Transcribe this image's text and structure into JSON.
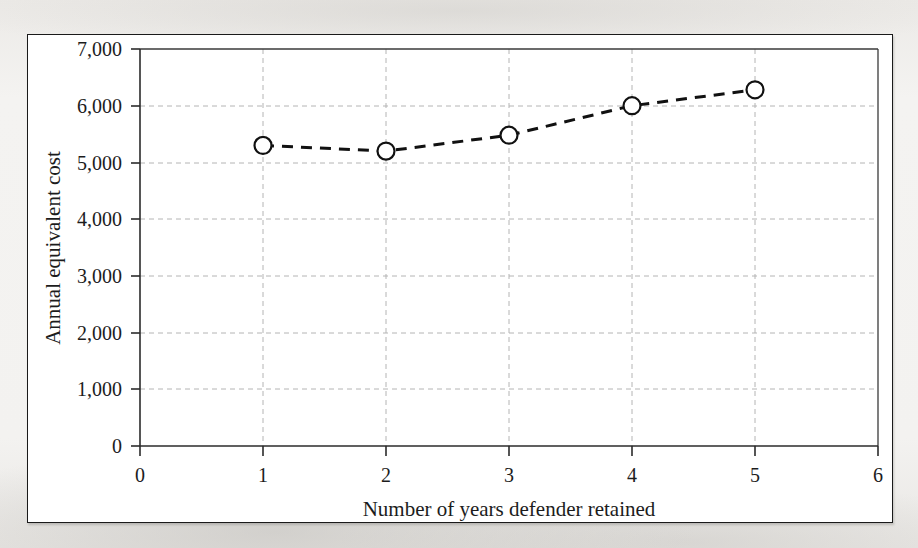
{
  "figure": {
    "background_color": "#f2f1ef",
    "panel_color": "#ffffff",
    "frame_color": "#1a1a1a"
  },
  "chart_data": {
    "type": "line",
    "title": "",
    "subtitle": "",
    "xlabel": "Number of years defender retained",
    "ylabel": "Annual equivalent cost",
    "x": [
      1,
      2,
      3,
      4,
      5
    ],
    "values": [
      5300,
      5200,
      5480,
      6000,
      6280
    ],
    "series": [
      {
        "name": "Annual equivalent cost",
        "x": [
          1,
          2,
          3,
          4,
          5
        ],
        "values": [
          5300,
          5200,
          5480,
          6000,
          6280
        ]
      }
    ],
    "xlim": [
      0,
      6
    ],
    "ylim": [
      0,
      7000
    ],
    "xticks": [
      0,
      1,
      2,
      3,
      4,
      5,
      6
    ],
    "xtick_labels": [
      "0",
      "1",
      "2",
      "3",
      "4",
      "5",
      "6"
    ],
    "yticks": [
      0,
      1000,
      2000,
      3000,
      4000,
      5000,
      6000,
      7000
    ],
    "ytick_labels": [
      "0",
      "1,000",
      "2,000",
      "3,000",
      "4,000",
      "5,000",
      "6,000",
      "7,000"
    ],
    "grid": true,
    "grid_style": "dashed",
    "grid_color": "#b4b4b4",
    "legend": false,
    "legend_position": "none",
    "line_color": "#111111",
    "line_style": "dashed",
    "line_width": 3,
    "marker": "circle-open",
    "marker_face_color": "#ffffff",
    "marker_edge_color": "#111111",
    "marker_size": 11,
    "annotations": []
  },
  "axes": {
    "y_axis_label": "Annual equivalent cost",
    "x_axis_label": "Number of years defender retained",
    "y_tick_0": "0",
    "y_tick_1000": "1,000",
    "y_tick_2000": "2,000",
    "y_tick_3000": "3,000",
    "y_tick_4000": "4,000",
    "y_tick_5000": "5,000",
    "y_tick_6000": "6,000",
    "y_tick_7000": "7,000",
    "x_tick_0": "0",
    "x_tick_1": "1",
    "x_tick_2": "2",
    "x_tick_3": "3",
    "x_tick_4": "4",
    "x_tick_5": "5",
    "x_tick_6": "6"
  }
}
